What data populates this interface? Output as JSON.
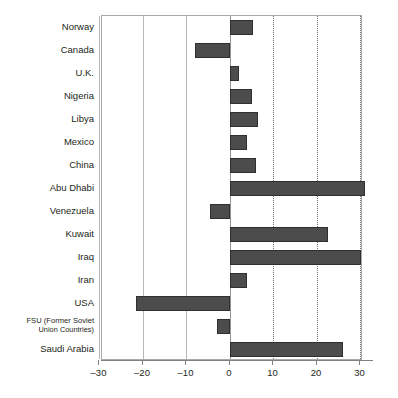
{
  "chart_data": {
    "type": "bar",
    "orientation": "horizontal",
    "title": "",
    "xlabel": "",
    "ylabel": "",
    "xlim": [
      -33,
      33
    ],
    "xticks": [
      -30,
      -20,
      -10,
      0,
      10,
      20,
      30
    ],
    "xtick_labels": [
      "–30",
      "–20",
      "–10",
      "0",
      "10",
      "20",
      "30"
    ],
    "grid": true,
    "legend": false,
    "categories": [
      "Norway",
      "Canada",
      "U.K.",
      "Nigeria",
      "Libya",
      "Mexico",
      "China",
      "Abu Dhabi",
      "Venezuela",
      "Kuwait",
      "Iraq",
      "Iran",
      "USA",
      "FSU (Former Soviet Union Countries)",
      "Saudi Arabia"
    ],
    "values": [
      5.3,
      -8.0,
      2.0,
      5.0,
      6.5,
      4.0,
      6.0,
      31.0,
      -4.5,
      22.5,
      30.0,
      4.0,
      -21.5,
      -3.0,
      26.0
    ]
  },
  "labels": {
    "rows": [
      {
        "text": "Norway",
        "sub": "",
        "two_line": false
      },
      {
        "text": "Canada",
        "sub": "",
        "two_line": false
      },
      {
        "text": "U.K.",
        "sub": "",
        "two_line": false
      },
      {
        "text": "Nigeria",
        "sub": "",
        "two_line": false
      },
      {
        "text": "Libya",
        "sub": "",
        "two_line": false
      },
      {
        "text": "Mexico",
        "sub": "",
        "two_line": false
      },
      {
        "text": "China",
        "sub": "",
        "two_line": false
      },
      {
        "text": "Abu Dhabi",
        "sub": "",
        "two_line": false
      },
      {
        "text": "Venezuela",
        "sub": "",
        "two_line": false
      },
      {
        "text": "Kuwait",
        "sub": "",
        "two_line": false
      },
      {
        "text": "Iraq",
        "sub": "",
        "two_line": false
      },
      {
        "text": "Iran",
        "sub": "",
        "two_line": false
      },
      {
        "text": "USA",
        "sub": "",
        "two_line": false
      },
      {
        "text": "FSU (Former Soviet",
        "sub": "Union Countries)",
        "two_line": true
      },
      {
        "text": "Saudi Arabia",
        "sub": "",
        "two_line": false
      }
    ]
  },
  "style": {
    "bar_fill": "#4c4c4c",
    "bar_stroke": "#2f2f2f",
    "frame_color": "#a7a9ac",
    "grid_solid_color": "#b5b7b9",
    "grid_dotted_color": "#6d6e71",
    "text_color": "#231f20",
    "background": "#ffffff"
  }
}
